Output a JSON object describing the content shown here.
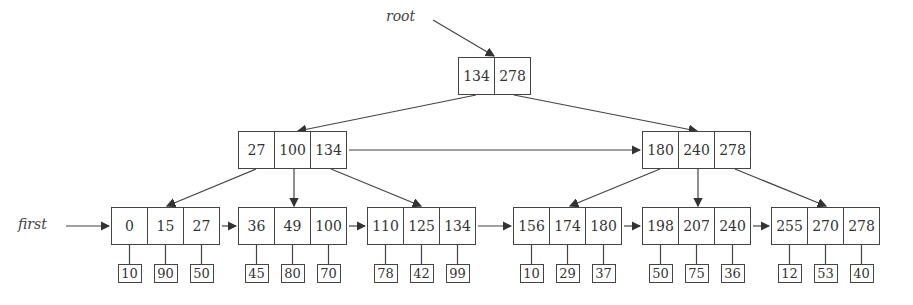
{
  "labels": {
    "root": "root",
    "first": "first"
  },
  "root": {
    "keys": [
      "134",
      "278"
    ]
  },
  "internal": [
    {
      "keys": [
        "27",
        "100",
        "134"
      ]
    },
    {
      "keys": [
        "180",
        "240",
        "278"
      ]
    }
  ],
  "leaves": [
    {
      "keys": [
        "0",
        "15",
        "27"
      ],
      "records": [
        "10",
        "90",
        "50"
      ]
    },
    {
      "keys": [
        "36",
        "49",
        "100"
      ],
      "records": [
        "45",
        "80",
        "70"
      ]
    },
    {
      "keys": [
        "110",
        "125",
        "134"
      ],
      "records": [
        "78",
        "42",
        "99"
      ]
    },
    {
      "keys": [
        "156",
        "174",
        "180"
      ],
      "records": [
        "10",
        "29",
        "37"
      ]
    },
    {
      "keys": [
        "198",
        "207",
        "240"
      ],
      "records": [
        "50",
        "75",
        "36"
      ]
    },
    {
      "keys": [
        "255",
        "270",
        "278"
      ],
      "records": [
        "12",
        "53",
        "40"
      ]
    }
  ]
}
